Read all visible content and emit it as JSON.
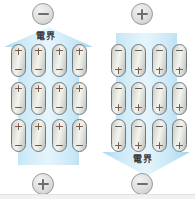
{
  "diagram": {
    "colors": {
      "arrow_fill": "#b9e0f4",
      "arrow_fill_light": "#e4f4fc",
      "badge_gray": "#dedede",
      "dipole_body": "#e7e7e2",
      "dipole_border": "#6f7a80",
      "label_text": "#3b3b3b"
    },
    "panels": [
      {
        "id": "left",
        "arrow_direction": "up",
        "field_label": "電界",
        "top_badge": "−",
        "top_badge_polarity": "minus",
        "bottom_badge": "+",
        "bottom_badge_polarity": "plus",
        "dipole_top_pole": "+",
        "dipole_bottom_pole": "−",
        "dipole_rows": 3,
        "dipole_columns": 4,
        "dipole_count": 12
      },
      {
        "id": "right",
        "arrow_direction": "down",
        "field_label": "電界",
        "top_badge": "+",
        "top_badge_polarity": "plus",
        "bottom_badge": "−",
        "bottom_badge_polarity": "minus",
        "dipole_top_pole": "−",
        "dipole_bottom_pole": "+",
        "dipole_rows": 3,
        "dipole_columns": 4,
        "dipole_count": 12
      }
    ]
  }
}
